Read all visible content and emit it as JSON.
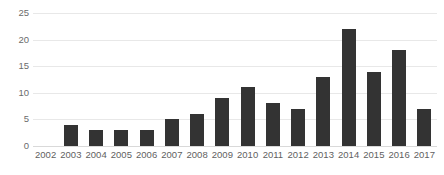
{
  "chart_data": {
    "type": "bar",
    "title": "",
    "subtitle": "",
    "xlabel": "",
    "ylabel": "",
    "categories": [
      "2002",
      "2003",
      "2004",
      "2005",
      "2006",
      "2007",
      "2008",
      "2009",
      "2010",
      "2011",
      "2012",
      "2013",
      "2014",
      "2015",
      "2016",
      "2017"
    ],
    "values": [
      0,
      4,
      3,
      3,
      3,
      5,
      6,
      9,
      11,
      8,
      7,
      13,
      22,
      14,
      18,
      7
    ],
    "series": [
      {
        "name": "",
        "values": [
          0,
          4,
          3,
          3,
          3,
          5,
          6,
          9,
          11,
          8,
          7,
          13,
          22,
          14,
          18,
          7
        ]
      }
    ],
    "ylim": [
      0,
      25
    ],
    "yticks": [
      0,
      5,
      10,
      15,
      20,
      25
    ],
    "ytick_labels": [
      "0",
      "5",
      "10",
      "15",
      "20",
      "25"
    ],
    "grid": true,
    "grid_axis": "y",
    "legend": false,
    "legend_position": "none",
    "bar_color": "#333333",
    "grid_color": "#e8e8e8",
    "axis_text_color": "#5f5f5f",
    "background_color": "#ffffff",
    "annotations": []
  }
}
